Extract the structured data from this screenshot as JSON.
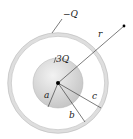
{
  "diagram": {
    "labels": {
      "shell_charge": "−Q",
      "sphere_charge": "3Q",
      "radius_a": "a",
      "radius_b": "b",
      "radius_c": "c",
      "distance_r": "r"
    },
    "colors": {
      "shell_fill": "#e4e4e4",
      "shell_stroke": "#bdbdbd",
      "sphere_fill": "#d8d8d8",
      "line": "#444444",
      "dot": "#000000"
    }
  }
}
